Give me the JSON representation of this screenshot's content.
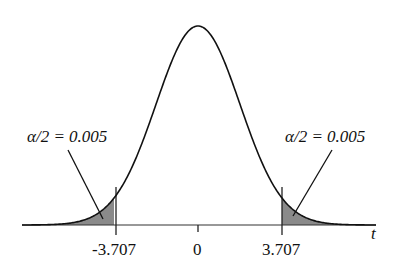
{
  "chart_data": {
    "type": "area",
    "title": "",
    "xlabel": "t",
    "ylabel": "",
    "distribution": "Student t density (two-tailed critical region)",
    "tick_labels": [
      "-3.707",
      "0",
      "3.707"
    ],
    "tick_values": [
      -3.707,
      0,
      3.707
    ],
    "critical_values": [
      -3.707,
      3.707
    ],
    "shaded_regions": [
      {
        "name": "left tail",
        "from": "-inf",
        "to": -3.707,
        "area": 0.005
      },
      {
        "name": "right tail",
        "from": 3.707,
        "to": "inf",
        "area": 0.005
      }
    ],
    "annotations": [
      {
        "text": "α/2 = 0.005",
        "points_to": "left tail"
      },
      {
        "text": "α/2 = 0.005",
        "points_to": "right tail"
      }
    ],
    "grid": false,
    "legend": null
  },
  "labels": {
    "left_annotation": "α/2 = 0.005",
    "right_annotation": "α/2 = 0.005",
    "tick_left": "-3.707",
    "tick_center": "0",
    "tick_right": "3.707",
    "axis_label": "t"
  },
  "colors": {
    "curve": "#111111",
    "tail_fill": "#888888",
    "axis": "#333333"
  }
}
